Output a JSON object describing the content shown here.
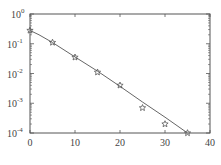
{
  "chart_data": {
    "type": "scatter",
    "title": "",
    "xlabel": "",
    "ylabel": "",
    "xlim": [
      0,
      40
    ],
    "ylim": [
      0.0001,
      1
    ],
    "yscale": "log",
    "grid": false,
    "x_ticks": [
      0,
      10,
      20,
      30,
      40
    ],
    "x_tick_labels": [
      "0",
      "10",
      "20",
      "30",
      "40"
    ],
    "y_ticks": [
      1,
      0.1,
      0.01,
      0.001,
      0.0001
    ],
    "y_tick_labels": [
      {
        "base": "10",
        "exp": "0"
      },
      {
        "base": "10",
        "exp": "-1"
      },
      {
        "base": "10",
        "exp": "-2"
      },
      {
        "base": "10",
        "exp": "-3"
      },
      {
        "base": "10",
        "exp": "-4"
      }
    ],
    "series": [
      {
        "name": "simulation",
        "marker": "star",
        "x": [
          0,
          5,
          10,
          15,
          20,
          25,
          30,
          35
        ],
        "values": [
          0.28,
          0.11,
          0.035,
          0.011,
          0.004,
          0.0007,
          0.0002,
          0.0001
        ]
      },
      {
        "name": "theory",
        "marker": "line",
        "x": [
          0,
          2,
          5,
          10,
          15,
          20,
          25,
          30,
          35
        ],
        "values": [
          0.28,
          0.2,
          0.11,
          0.036,
          0.012,
          0.0037,
          0.0011,
          0.00034,
          0.0001
        ]
      }
    ],
    "colors": {
      "axis": "#555555",
      "line": "#666666",
      "marker": "#555555"
    }
  }
}
